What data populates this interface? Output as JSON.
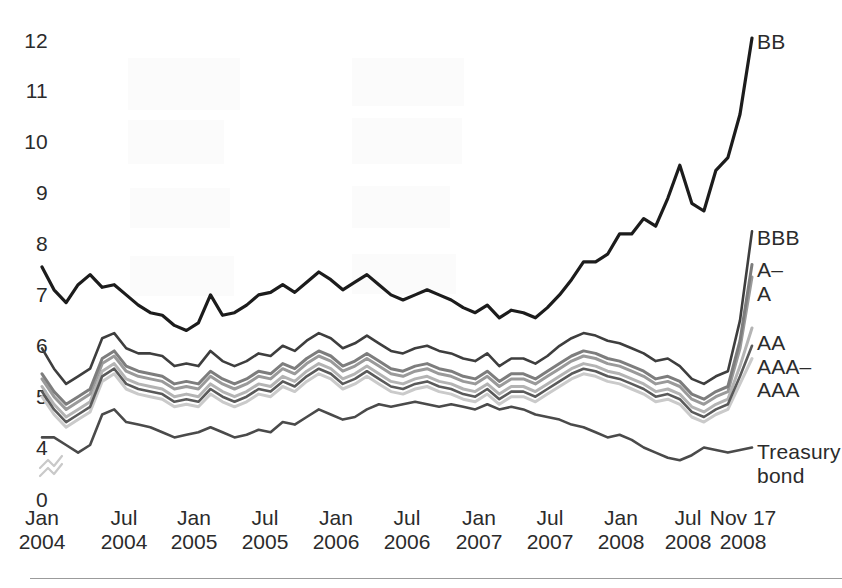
{
  "axes": {
    "y_ticks": [
      "12",
      "11",
      "10",
      "9",
      "8",
      "7",
      "6",
      "5",
      "4",
      "0"
    ],
    "x_ticks": [
      {
        "top": "Jan",
        "bottom": "2004"
      },
      {
        "top": "Jul",
        "bottom": "2004"
      },
      {
        "top": "Jan",
        "bottom": "2005"
      },
      {
        "top": "Jul",
        "bottom": "2005"
      },
      {
        "top": "Jan",
        "bottom": "2006"
      },
      {
        "top": "Jul",
        "bottom": "2006"
      },
      {
        "top": "Jan",
        "bottom": "2007"
      },
      {
        "top": "Jul",
        "bottom": "2007"
      },
      {
        "top": "Jan",
        "bottom": "2008"
      },
      {
        "top": "Jul",
        "bottom": "2008"
      },
      {
        "top": "Nov 17",
        "bottom": "2008"
      }
    ]
  },
  "series_labels": [
    {
      "name": "BB",
      "line1": "BB",
      "line2": ""
    },
    {
      "name": "BBB",
      "line1": "BBB",
      "line2": ""
    },
    {
      "name": "A-minus",
      "line1": "A–",
      "line2": ""
    },
    {
      "name": "A",
      "line1": "A",
      "line2": ""
    },
    {
      "name": "AA",
      "line1": "AA",
      "line2": ""
    },
    {
      "name": "AAA-minus",
      "line1": "AAA–",
      "line2": ""
    },
    {
      "name": "AAA",
      "line1": "AAA",
      "line2": ""
    },
    {
      "name": "Treasury",
      "line1": "Treasury",
      "line2": "bond"
    }
  ],
  "chart_data": {
    "type": "line",
    "title": "",
    "xlabel": "",
    "ylabel": "",
    "ylim": [
      0,
      12.4
    ],
    "y_tick_values": [
      12,
      11,
      10,
      9,
      8,
      7,
      6,
      5,
      4,
      0
    ],
    "y_axis_break": {
      "between": [
        4,
        0
      ],
      "symbol": "double-zigzag"
    },
    "grid": false,
    "legend": "right-of-plot (direct line labels)",
    "x_tick_labels": [
      "Jan 2004",
      "Jul 2004",
      "Jan 2005",
      "Jul 2005",
      "Jan 2006",
      "Jul 2006",
      "Jan 2007",
      "Jul 2007",
      "Jan 2008",
      "Jul 2008",
      "Nov 17 2008"
    ],
    "x_index_range": [
      0,
      59
    ],
    "colors": {
      "BB": "#1c1c1c",
      "BBB": "#3e3e3e",
      "A-minus": "#7d7d7d",
      "A": "#9a9a9a",
      "AA": "#b4b4b4",
      "AAA-minus": "#5a5a5a",
      "AAA": "#cacaca",
      "Treasury": "#4a4a4a"
    },
    "series": [
      {
        "name": "BB",
        "values": [
          7.5,
          7.05,
          6.8,
          7.15,
          7.35,
          7.1,
          7.15,
          6.95,
          6.75,
          6.6,
          6.55,
          6.35,
          6.25,
          6.4,
          6.95,
          6.55,
          6.6,
          6.75,
          6.95,
          7.0,
          7.15,
          7.0,
          7.2,
          7.4,
          7.25,
          7.05,
          7.2,
          7.35,
          7.15,
          6.95,
          6.85,
          6.95,
          7.05,
          6.95,
          6.85,
          6.7,
          6.6,
          6.75,
          6.5,
          6.65,
          6.6,
          6.5,
          6.7,
          6.95,
          7.25,
          7.6,
          7.6,
          7.75,
          8.15,
          8.15,
          8.45,
          8.3,
          8.85,
          9.5,
          8.75,
          8.6,
          9.4,
          9.65,
          10.5,
          12.0
        ]
      },
      {
        "name": "BBB",
        "values": [
          5.9,
          5.5,
          5.2,
          5.35,
          5.5,
          6.1,
          6.2,
          5.9,
          5.8,
          5.8,
          5.75,
          5.55,
          5.6,
          5.55,
          5.85,
          5.65,
          5.55,
          5.65,
          5.8,
          5.75,
          5.95,
          5.85,
          6.05,
          6.2,
          6.1,
          5.9,
          6.0,
          6.15,
          6.0,
          5.85,
          5.8,
          5.9,
          5.95,
          5.85,
          5.8,
          5.7,
          5.65,
          5.8,
          5.55,
          5.7,
          5.7,
          5.6,
          5.75,
          5.95,
          6.1,
          6.2,
          6.15,
          6.05,
          6.0,
          5.9,
          5.8,
          5.65,
          5.7,
          5.55,
          5.3,
          5.2,
          5.35,
          5.45,
          6.45,
          8.2
        ]
      },
      {
        "name": "A-minus",
        "values": [
          5.4,
          5.05,
          4.8,
          4.95,
          5.1,
          5.7,
          5.85,
          5.55,
          5.45,
          5.4,
          5.35,
          5.2,
          5.25,
          5.2,
          5.45,
          5.3,
          5.2,
          5.3,
          5.45,
          5.4,
          5.6,
          5.5,
          5.7,
          5.85,
          5.75,
          5.55,
          5.65,
          5.8,
          5.65,
          5.5,
          5.45,
          5.55,
          5.6,
          5.5,
          5.45,
          5.35,
          5.3,
          5.45,
          5.25,
          5.4,
          5.4,
          5.3,
          5.45,
          5.6,
          5.75,
          5.85,
          5.8,
          5.7,
          5.65,
          5.55,
          5.45,
          5.3,
          5.35,
          5.25,
          5.0,
          4.9,
          5.05,
          5.15,
          6.05,
          7.55
        ]
      },
      {
        "name": "A",
        "values": [
          5.3,
          4.95,
          4.7,
          4.85,
          5.0,
          5.6,
          5.75,
          5.45,
          5.35,
          5.3,
          5.25,
          5.1,
          5.15,
          5.1,
          5.35,
          5.2,
          5.1,
          5.2,
          5.35,
          5.3,
          5.5,
          5.4,
          5.6,
          5.75,
          5.65,
          5.45,
          5.55,
          5.7,
          5.55,
          5.4,
          5.35,
          5.45,
          5.5,
          5.4,
          5.35,
          5.25,
          5.2,
          5.35,
          5.15,
          5.3,
          5.3,
          5.2,
          5.35,
          5.5,
          5.65,
          5.75,
          5.7,
          5.6,
          5.55,
          5.45,
          5.35,
          5.2,
          5.25,
          5.15,
          4.9,
          4.8,
          4.95,
          5.05,
          5.9,
          7.3
        ]
      },
      {
        "name": "AA",
        "values": [
          5.15,
          4.8,
          4.55,
          4.7,
          4.85,
          5.45,
          5.6,
          5.3,
          5.2,
          5.15,
          5.1,
          4.95,
          5.0,
          4.95,
          5.2,
          5.05,
          4.95,
          5.05,
          5.2,
          5.15,
          5.35,
          5.25,
          5.45,
          5.6,
          5.5,
          5.3,
          5.4,
          5.55,
          5.4,
          5.25,
          5.2,
          5.3,
          5.35,
          5.25,
          5.2,
          5.1,
          5.05,
          5.2,
          5.0,
          5.15,
          5.15,
          5.05,
          5.2,
          5.35,
          5.5,
          5.6,
          5.55,
          5.45,
          5.4,
          5.3,
          5.2,
          5.05,
          5.1,
          5.0,
          4.75,
          4.65,
          4.8,
          4.9,
          5.55,
          6.3
        ]
      },
      {
        "name": "AAA-minus",
        "values": [
          5.05,
          4.7,
          4.45,
          4.6,
          4.75,
          5.35,
          5.5,
          5.2,
          5.1,
          5.05,
          5.0,
          4.85,
          4.9,
          4.85,
          5.1,
          4.95,
          4.85,
          4.95,
          5.1,
          5.05,
          5.25,
          5.15,
          5.35,
          5.5,
          5.4,
          5.2,
          5.3,
          5.45,
          5.3,
          5.15,
          5.1,
          5.2,
          5.25,
          5.15,
          5.1,
          5.0,
          4.95,
          5.1,
          4.9,
          5.05,
          5.05,
          4.95,
          5.1,
          5.25,
          5.4,
          5.5,
          5.45,
          5.35,
          5.3,
          5.2,
          5.1,
          4.95,
          5.0,
          4.9,
          4.65,
          4.55,
          4.7,
          4.8,
          5.35,
          5.95
        ]
      },
      {
        "name": "AAA",
        "values": [
          4.95,
          4.6,
          4.35,
          4.5,
          4.65,
          5.25,
          5.4,
          5.1,
          5.0,
          4.95,
          4.9,
          4.75,
          4.8,
          4.75,
          5.0,
          4.85,
          4.75,
          4.85,
          5.0,
          4.95,
          5.15,
          5.05,
          5.25,
          5.4,
          5.3,
          5.1,
          5.2,
          5.35,
          5.2,
          5.05,
          5.0,
          5.1,
          5.15,
          5.05,
          5.0,
          4.9,
          4.85,
          5.0,
          4.8,
          4.95,
          4.95,
          4.85,
          5.0,
          5.15,
          5.3,
          5.4,
          5.35,
          5.25,
          5.2,
          5.1,
          5.0,
          4.85,
          4.9,
          4.8,
          4.55,
          4.45,
          4.6,
          4.7,
          5.2,
          5.7
        ]
      },
      {
        "name": "Treasury",
        "values": [
          4.15,
          4.15,
          4.0,
          3.85,
          4.0,
          4.6,
          4.7,
          4.45,
          4.4,
          4.35,
          4.25,
          4.15,
          4.2,
          4.25,
          4.35,
          4.25,
          4.15,
          4.2,
          4.3,
          4.25,
          4.45,
          4.4,
          4.55,
          4.7,
          4.6,
          4.5,
          4.55,
          4.7,
          4.8,
          4.75,
          4.8,
          4.85,
          4.8,
          4.75,
          4.8,
          4.75,
          4.7,
          4.8,
          4.7,
          4.75,
          4.7,
          4.6,
          4.55,
          4.5,
          4.4,
          4.35,
          4.25,
          4.15,
          4.2,
          4.1,
          3.95,
          3.85,
          3.75,
          3.7,
          3.8,
          3.95,
          3.9,
          3.85,
          3.9,
          3.95
        ]
      }
    ]
  }
}
